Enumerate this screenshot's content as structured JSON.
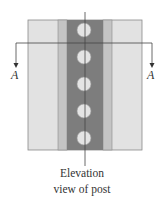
{
  "diagram": {
    "caption_line1": "Elevation",
    "caption_line2": "view of post",
    "section_label_left": "A",
    "section_label_right": "A",
    "colors": {
      "outer_fill": "#e2e2e2",
      "mid_stripe": "#c4c4c4",
      "core_band": "#7d7d7d",
      "hole_fill": "#e4e4e4",
      "line": "#333333"
    },
    "holes_count": 5
  }
}
